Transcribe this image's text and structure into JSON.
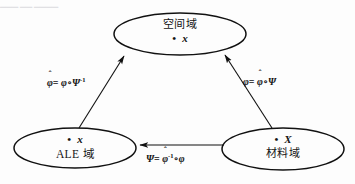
{
  "figure": {
    "type": "commutative-mapping-diagram",
    "top_partial_text": "▁▁▁ ▁▁ ▁▁▁▁",
    "background": "#fdfdfd",
    "stroke": "#111111"
  },
  "nodes": {
    "spatial": {
      "id": "spatial-domain",
      "title": "空间域",
      "point_dot": "•",
      "point_symbol": "x",
      "cx": 180,
      "cy": 34,
      "rx": 66,
      "ry": 21
    },
    "ale": {
      "id": "ale-domain",
      "title": "ALE 域",
      "point_dot": "•",
      "point_symbol": "x",
      "cx": 75,
      "cy": 148,
      "rx": 61,
      "ry": 20
    },
    "material": {
      "id": "material-domain",
      "title": "材料域",
      "point_dot": "•",
      "point_symbol": "X",
      "cx": 283,
      "cy": 149,
      "rx": 61,
      "ry": 21
    }
  },
  "edges": {
    "ale_to_spatial": {
      "id": "edge-ale-to-spatial",
      "label": {
        "lhs_hat": "ˆ",
        "lhs": "φ",
        "equals": "=",
        "rhs_1": "φ",
        "compose": "∘",
        "rhs_2": "Ψ",
        "rhs_2_sup": "-1"
      },
      "from": "ale",
      "to": "spatial",
      "direction": "up-right"
    },
    "material_to_spatial": {
      "id": "edge-material-to-spatial",
      "label": {
        "lhs": "φ",
        "equals": "=",
        "rhs_1": "φ",
        "rhs_1_hat": "ˆ",
        "compose": "∘",
        "rhs_2": "Ψ"
      },
      "from": "material",
      "to": "spatial",
      "direction": "up-left"
    },
    "material_to_ale": {
      "id": "edge-material-to-ale",
      "label": {
        "lhs": "Ψ",
        "equals": "=",
        "rhs_1": "φ",
        "rhs_1_hat": "ˆ",
        "rhs_1_sup": "-1",
        "compose": "∘",
        "rhs_2": "φ"
      },
      "from": "material",
      "to": "ale",
      "direction": "left"
    }
  }
}
